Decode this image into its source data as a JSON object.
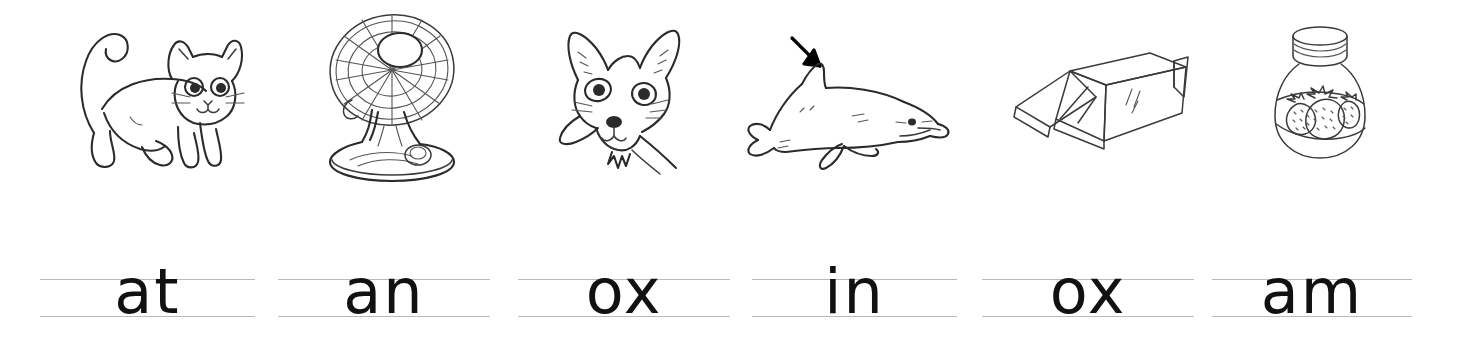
{
  "worksheet": {
    "title": "Beginning sounds handwriting practice",
    "background_color": "#ffffff",
    "ink_color": "#2b2b2b",
    "rule_color": "#b9b9b9",
    "columns": 6
  },
  "items": [
    {
      "picture_name": "cat",
      "picture_label": "cat",
      "word": "at",
      "picture_left": 60,
      "picture_width": 190,
      "write_left": 40,
      "write_width": 215
    },
    {
      "picture_name": "electric-fan",
      "picture_label": "fan",
      "word": "an",
      "picture_left": 300,
      "picture_width": 185,
      "write_left": 278,
      "write_width": 212
    },
    {
      "picture_name": "fox",
      "picture_label": "fox",
      "word": "ox",
      "picture_left": 540,
      "picture_width": 170,
      "write_left": 518,
      "write_width": 212
    },
    {
      "picture_name": "dolphin",
      "picture_label": "fin",
      "word": "in",
      "picture_left": 740,
      "picture_width": 225,
      "write_left": 752,
      "write_width": 205
    },
    {
      "picture_name": "cardboard-box",
      "picture_label": "box",
      "word": "ox",
      "picture_left": 998,
      "picture_width": 200,
      "write_left": 982,
      "write_width": 212
    },
    {
      "picture_name": "jam-jar",
      "picture_label": "jam",
      "word": "am",
      "picture_left": 1255,
      "picture_width": 130,
      "write_left": 1212,
      "write_width": 200
    }
  ]
}
